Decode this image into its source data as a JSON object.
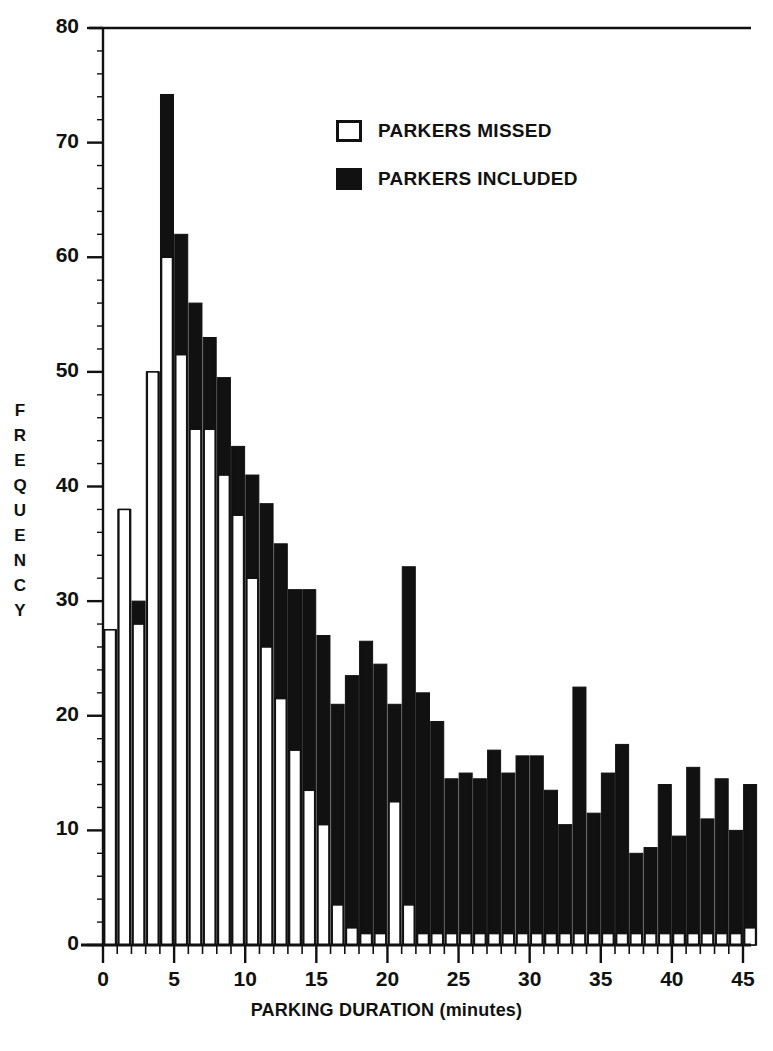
{
  "chart_data": {
    "type": "bar",
    "title": "",
    "subtitle": "",
    "xlabel": "PARKING DURATION (minutes)",
    "ylabel": "FREQUENCY",
    "xlim": [
      0,
      45.5
    ],
    "ylim": [
      0,
      80
    ],
    "grid": false,
    "bar_width_minutes": 1,
    "stacked": true,
    "legend_position": "upper-center",
    "legend": [
      "PARKERS MISSED",
      "PARKERS INCLUDED"
    ],
    "x_ticks_major": [
      0,
      5,
      10,
      15,
      20,
      25,
      30,
      35,
      40,
      45
    ],
    "x_tick_labels": [
      "0",
      "5",
      "10",
      "15",
      "20",
      "25",
      "30",
      "35",
      "40",
      "45"
    ],
    "x_minor_tick_step": 1,
    "y_ticks_major": [
      0,
      10,
      20,
      30,
      40,
      50,
      60,
      70,
      80
    ],
    "y_tick_labels": [
      "0",
      "10",
      "20",
      "30",
      "40",
      "50",
      "60",
      "70",
      "80"
    ],
    "y_minor_tick_step": 2,
    "categories": [
      0,
      1,
      2,
      3,
      4,
      5,
      6,
      7,
      8,
      9,
      10,
      11,
      12,
      13,
      14,
      15,
      16,
      17,
      18,
      19,
      20,
      21,
      22,
      23,
      24,
      25,
      26,
      27,
      28,
      29,
      30,
      31,
      32,
      33,
      34,
      35,
      36,
      37,
      38,
      39,
      40,
      41,
      42,
      43,
      44,
      45
    ],
    "series": [
      {
        "name": "PARKERS MISSED",
        "color": "#ffffff",
        "edgecolor": "#111111",
        "values": [
          27.5,
          38,
          28,
          50,
          60,
          51.5,
          45,
          45,
          41,
          37.5,
          32,
          26,
          21.5,
          17,
          13.5,
          10.5,
          3.5,
          1.5,
          1,
          1,
          12.5,
          3.5,
          1,
          1,
          1,
          1,
          1,
          1,
          1,
          1,
          1,
          1,
          1,
          1,
          1,
          1,
          1,
          1,
          1,
          1,
          1,
          1,
          1,
          1,
          1,
          1.5
        ]
      },
      {
        "name": "PARKERS INCLUDED",
        "color": "#111111",
        "edgecolor": "#111111",
        "values": [
          27.5,
          38,
          30,
          50,
          74.2,
          62,
          56,
          53,
          49.5,
          43.5,
          41,
          38.5,
          35,
          31,
          31,
          27,
          21,
          23.5,
          26.5,
          24.5,
          21,
          33,
          22,
          19.5,
          14.5,
          15,
          14.5,
          17,
          15,
          16.5,
          16.5,
          13.5,
          10.5,
          22.5,
          11.5,
          15,
          17.5,
          8,
          8.5,
          14,
          9.5,
          15.5,
          11,
          14.5,
          10,
          14
        ]
      }
    ],
    "values_total": [
      27.5,
      38,
      30,
      50,
      74.2,
      62,
      56,
      53,
      49.5,
      43.5,
      41,
      38.5,
      35,
      31,
      31,
      27,
      21,
      23.5,
      26.5,
      24.5,
      21,
      33,
      22,
      19.5,
      14.5,
      15,
      14.5,
      17,
      15,
      16.5,
      16.5,
      13.5,
      10.5,
      22.5,
      11.5,
      15,
      17.5,
      8,
      8.5,
      14,
      9.5,
      15.5,
      11,
      14.5,
      10,
      14
    ],
    "values_missed": [
      27.5,
      38,
      28,
      50,
      60,
      51.5,
      45,
      45,
      41,
      37.5,
      32,
      26,
      21.5,
      17,
      13.5,
      10.5,
      3.5,
      1.5,
      1,
      1,
      12.5,
      3.5,
      1,
      1,
      1,
      1,
      1,
      1,
      1,
      1,
      1,
      1,
      1,
      1,
      1,
      1,
      1,
      1,
      1,
      1,
      1,
      1,
      1,
      1,
      1,
      1.5
    ]
  },
  "axis": {
    "y_title_letters": [
      "F",
      "R",
      "E",
      "Q",
      "U",
      "E",
      "N",
      "C",
      "Y"
    ],
    "x_title": "PARKING DURATION (minutes)"
  },
  "legend": {
    "items": [
      {
        "label": "PARKERS MISSED",
        "swatch": "hollow"
      },
      {
        "label": "PARKERS INCLUDED",
        "swatch": "filled"
      }
    ]
  },
  "colors": {
    "ink": "#111111",
    "paper": "#ffffff"
  }
}
